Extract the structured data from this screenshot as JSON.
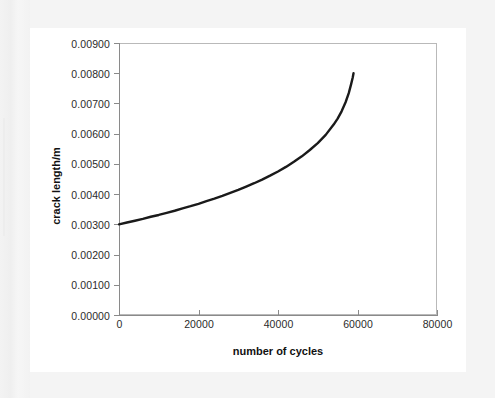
{
  "figure": {
    "background_color": "#f4f4f4",
    "card_color": "#ffffff",
    "plot_border_color": "#b9b9b9",
    "axis_color": "#8a8a8a"
  },
  "chart_data": {
    "type": "line",
    "title": "",
    "subtitle": "",
    "xlabel": "number of cycles",
    "ylabel": "crack length/m",
    "xlim": [
      0,
      80000
    ],
    "ylim": [
      0.0,
      0.009
    ],
    "grid": false,
    "legend": false,
    "legend_position": "none",
    "line_color": "#1a1a1a",
    "line_width_px": 2.4,
    "xticks": [
      0,
      20000,
      40000,
      60000,
      80000
    ],
    "xtick_labels": [
      "0",
      "20000",
      "40000",
      "60000",
      "80000"
    ],
    "yticks": [
      0.0,
      0.001,
      0.002,
      0.003,
      0.004,
      0.005,
      0.006,
      0.007,
      0.008,
      0.009
    ],
    "ytick_labels": [
      "0.00000",
      "0.00100",
      "0.00200",
      "0.00300",
      "0.00400",
      "0.00500",
      "0.00600",
      "0.00700",
      "0.00800",
      "0.00900"
    ],
    "series": [
      {
        "name": "crack growth",
        "x": [
          0,
          2000,
          4000,
          6000,
          8000,
          10000,
          12000,
          14000,
          16000,
          18000,
          20000,
          22000,
          24000,
          26000,
          28000,
          30000,
          32000,
          34000,
          36000,
          38000,
          40000,
          42000,
          44000,
          46000,
          48000,
          50000,
          52000,
          54000,
          55000,
          56000,
          57000,
          57800,
          58400,
          58800,
          59000
        ],
        "y": [
          0.003,
          0.00306,
          0.00312,
          0.00318,
          0.00325,
          0.00331,
          0.00338,
          0.00345,
          0.00353,
          0.0036,
          0.00368,
          0.00377,
          0.00385,
          0.00394,
          0.00404,
          0.00414,
          0.00425,
          0.00436,
          0.00448,
          0.00461,
          0.00475,
          0.0049,
          0.00507,
          0.00525,
          0.00546,
          0.00569,
          0.00596,
          0.0063,
          0.0065,
          0.00674,
          0.00704,
          0.00734,
          0.00764,
          0.00786,
          0.008
        ]
      }
    ],
    "annotations": []
  }
}
